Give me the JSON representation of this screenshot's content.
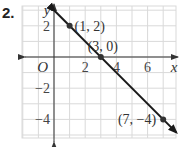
{
  "problem": {
    "number": "2."
  },
  "chart_data": {
    "type": "line",
    "title": "",
    "xlabel": "x",
    "ylabel": "y",
    "origin_label": "O",
    "xlim": [
      -2,
      7.7
    ],
    "ylim": [
      -5.2,
      3.2
    ],
    "grid": true,
    "x_ticks": [
      {
        "value": 2,
        "label": "2"
      },
      {
        "value": 4,
        "label": "4"
      },
      {
        "value": 6,
        "label": "6"
      }
    ],
    "y_ticks": [
      {
        "value": 2,
        "label": "2"
      },
      {
        "value": -2,
        "label": "−2"
      },
      {
        "value": -4,
        "label": "−4"
      }
    ],
    "series": [
      {
        "name": "line",
        "equation": "y = -x + 3",
        "points": [
          {
            "x": 1,
            "y": 2,
            "label": "(1, 2)"
          },
          {
            "x": 3,
            "y": 0,
            "label": "(3, 0)"
          },
          {
            "x": 7,
            "y": -4,
            "label": "(7, −4)"
          }
        ],
        "arrows_both_ends": true
      }
    ],
    "colors": {
      "grid": "#d9d9d9",
      "axis": "#333333",
      "line": "#1a1a1a",
      "point": "#333333"
    }
  }
}
